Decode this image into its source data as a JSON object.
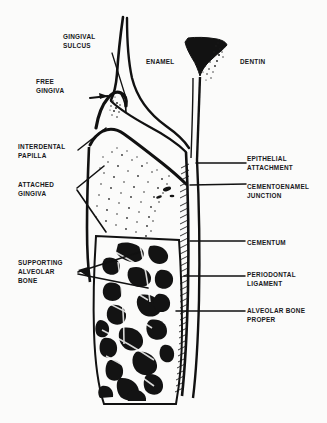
{
  "figure": {
    "background_color": "#fbfbfa",
    "ink_color": "#111111"
  },
  "labels": {
    "gingival_sulcus": "GINGIVAL\nSULCUS",
    "free_gingiva": "FREE\nGINGIVA",
    "interdental_papilla": "INTERDENTAL\nPAPILLA",
    "attached_gingiva": "ATTACHED\nGINGIVA",
    "supporting_alveolar_bone": "SUPPORTING\nALVEOLAR\nBONE",
    "enamel": "ENAMEL",
    "dentin": "DENTIN",
    "epithelial_attachment": "EPITHELIAL\nATTACHMENT",
    "cementoenamel_junction": "CEMENTOENAMEL\nJUNCTION",
    "cementum": "CEMENTUM",
    "periodontal_ligament": "PERIODONTAL\nLIGAMENT",
    "alveolar_bone_proper": "ALVEOLAR BONE\nPROPER"
  },
  "structures": {
    "crown_enamel": "enamel-outline",
    "dentin_mass": "dentin-funnel",
    "gingival_tissue": "gingiva-peak",
    "tooth_root": "root-outline",
    "pdl_hatching": "periodontal-ligament-hatching",
    "trabecular_bone": "supporting-alveolar-bone-trabeculae",
    "stipple_field": "cancellous-bone-stippling"
  }
}
